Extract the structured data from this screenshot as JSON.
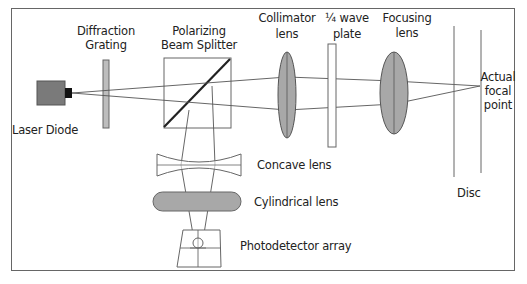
{
  "diagram": {
    "labels": {
      "laser_diode": "Laser Diode",
      "diffraction_grating_line1": "Diffraction",
      "diffraction_grating_line2": "Grating",
      "beam_splitter_line1": "Polarizing",
      "beam_splitter_line2": "Beam Splitter",
      "collimator_line1": "Collimator",
      "collimator_line2": "lens",
      "wave_plate_line1": "¼ wave",
      "wave_plate_line2": "plate",
      "focusing_line1": "Focusing",
      "focusing_line2": "lens",
      "focal_line1": "Actual",
      "focal_line2": "focal",
      "focal_line3": "point",
      "disc": "Disc",
      "concave_lens": "Concave lens",
      "cylindrical_lens": "Cylindrical lens",
      "photodetector": "Photodetector array"
    },
    "colors": {
      "stroke": "#555555",
      "lens_fill": "#a8a8a8",
      "laser_body": "#7a7a7a",
      "emitter": "#111111",
      "grating_fill": "#bdbdbd",
      "frame": "#666666"
    }
  }
}
